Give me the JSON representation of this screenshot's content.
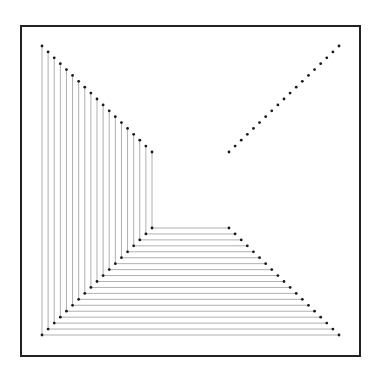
{
  "diagram": {
    "frame": {
      "x": 21,
      "y": 26,
      "width": 339,
      "height": 330,
      "stroke": "#222222",
      "stroke_width": 2
    },
    "outer": {
      "left": 42,
      "top": 46,
      "right": 339,
      "bottom": 335
    },
    "inner": {
      "left": 152,
      "top": 152,
      "right": 229,
      "bottom": 228
    },
    "points_per_diagonal": 19,
    "colors": {
      "dot": "#1a1a1a",
      "line": "#b0b0b0",
      "background": "#ffffff"
    },
    "dot_radius": 1.4,
    "line_width": 1
  }
}
